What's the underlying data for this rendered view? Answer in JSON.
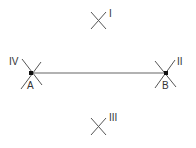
{
  "diagram": {
    "type": "perpendicular-bisector-construction",
    "colors": {
      "line": "#666666",
      "arcs": "#555555",
      "points": "#111111",
      "text": "#333333"
    },
    "segment": {
      "from": "A",
      "to": "B"
    },
    "points": [
      {
        "label": "A",
        "x": 31,
        "y": 73
      },
      {
        "label": "B",
        "x": 166,
        "y": 73
      }
    ],
    "arc_marks": [
      {
        "label": "I",
        "x": 98,
        "y": 20
      },
      {
        "label": "II",
        "x": 166,
        "y": 73
      },
      {
        "label": "III",
        "x": 98,
        "y": 127
      },
      {
        "label": "IV",
        "x": 31,
        "y": 73
      }
    ]
  }
}
